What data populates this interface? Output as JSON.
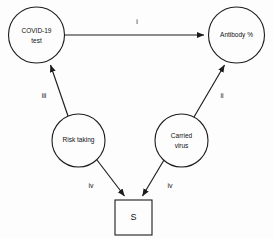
{
  "diagram": {
    "background_color": "#fdfdfd",
    "stroke_color": "#1c1c1c",
    "nodes": [
      {
        "id": "covid_test",
        "label_line1": "COVID-19",
        "label_line2": "test",
        "shape": "circle",
        "cx": 36.5,
        "cy": 35,
        "r": 28
      },
      {
        "id": "antibody",
        "label_line1": "Antibody %",
        "label_line2": "",
        "shape": "circle",
        "cx": 236.5,
        "cy": 35,
        "r": 28
      },
      {
        "id": "risk_taking",
        "label_line1": "Risk taking",
        "label_line2": "",
        "shape": "circle",
        "cx": 78.5,
        "cy": 140.5,
        "r": 26.5
      },
      {
        "id": "carried_virus",
        "label_line1": "Carried",
        "label_line2": "virus",
        "shape": "circle",
        "cx": 181.5,
        "cy": 140.5,
        "r": 26.5
      },
      {
        "id": "s_box",
        "label_line1": "S",
        "label_line2": "",
        "shape": "square",
        "x": 115,
        "y": 200,
        "w": 37,
        "h": 35
      }
    ],
    "edges": [
      {
        "id": "covid_to_antibody",
        "from": "covid_test",
        "to": "antibody",
        "label": "i",
        "label_x": 137,
        "label_y": 22
      },
      {
        "id": "risk_to_covid",
        "from": "risk_taking",
        "to": "covid_test",
        "label": "iii",
        "label_x": 44,
        "label_y": 96
      },
      {
        "id": "carried_to_antibody",
        "from": "carried_virus",
        "to": "antibody",
        "label": "ii",
        "label_x": 222,
        "label_y": 96
      },
      {
        "id": "risk_to_s",
        "from": "risk_taking",
        "to": "s_box",
        "label": "iv",
        "label_x": 91,
        "label_y": 186
      },
      {
        "id": "carried_to_s",
        "from": "carried_virus",
        "to": "s_box",
        "label": "iv",
        "label_x": 170,
        "label_y": 186
      }
    ]
  }
}
